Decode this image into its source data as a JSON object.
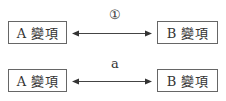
{
  "diagram": {
    "rows": [
      {
        "left_box": "A 變項",
        "right_box": "B 變項",
        "relation_label": "①",
        "arrow": "bidirectional"
      },
      {
        "left_box": "A 變項",
        "right_box": "B 變項",
        "relation_label": "a",
        "arrow": "bidirectional"
      }
    ]
  }
}
